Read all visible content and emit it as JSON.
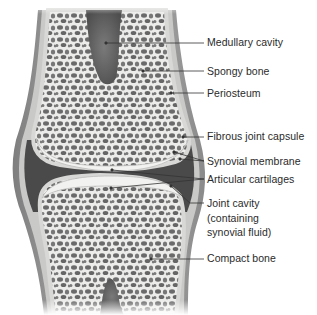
{
  "diagram": {
    "colors": {
      "background": "#ffffff",
      "bone_matrix": "#ececea",
      "pores": "#6e6e6e",
      "capsule": "#9a9a9a",
      "joint_cavity": "#4a4a4a",
      "leader_line": "#333333",
      "label_text": "#2a2a2a"
    },
    "labels": [
      {
        "id": "medullary-cavity",
        "text": "Medullary cavity",
        "y": 36
      },
      {
        "id": "spongy-bone",
        "text": "Spongy bone",
        "y": 65
      },
      {
        "id": "periosteum",
        "text": "Periosteum",
        "y": 87
      },
      {
        "id": "fibrous-joint-capsule",
        "text": "Fibrous joint capsule",
        "y": 130
      },
      {
        "id": "synovial-membrane",
        "text": "Synovial membrane",
        "y": 155
      },
      {
        "id": "articular-cartilages",
        "text": "Articular cartilages",
        "y": 173
      },
      {
        "id": "joint-cavity",
        "lines": [
          "Joint cavity",
          "(containing",
          "synovial fluid)"
        ],
        "y": 197
      },
      {
        "id": "compact-bone",
        "text": "Compact bone",
        "y": 252
      }
    ]
  }
}
